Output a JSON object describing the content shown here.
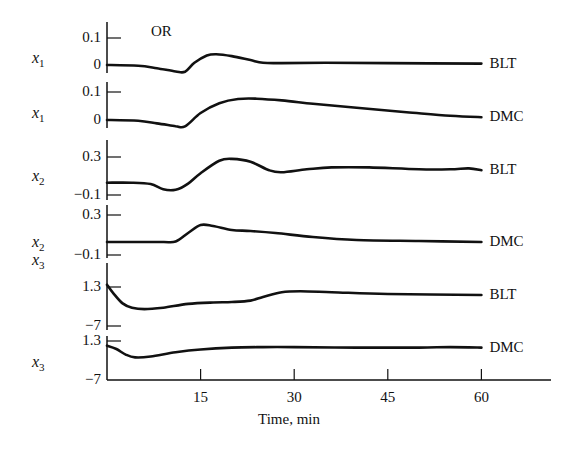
{
  "chart_data": {
    "type": "line",
    "title": "OR",
    "xlabel": "Time, min",
    "x_ticks": [
      15,
      30,
      45,
      60
    ],
    "xlim": [
      0,
      75
    ],
    "grid": false,
    "legend_position": "inline-right",
    "panels": [
      {
        "ylabel": "x1",
        "ylabel_var": "x",
        "ylabel_sub": "1",
        "series_label": "BLT",
        "y_ticks": [
          "0.1",
          "0"
        ],
        "y_tick_values": [
          0.1,
          0
        ],
        "x": [
          0,
          5,
          8,
          11,
          12.5,
          14,
          16,
          17.5,
          20,
          23,
          25,
          28,
          35,
          45,
          60
        ],
        "values": [
          0.0,
          -0.003,
          -0.012,
          -0.024,
          -0.025,
          0.008,
          0.035,
          0.04,
          0.033,
          0.018,
          0.008,
          0.007,
          0.008,
          0.007,
          0.005
        ]
      },
      {
        "ylabel": "x1",
        "ylabel_var": "x",
        "ylabel_sub": "1",
        "series_label": "DMC",
        "y_ticks": [
          "0.1",
          "0"
        ],
        "y_tick_values": [
          0.1,
          0
        ],
        "x": [
          0,
          5,
          8,
          11,
          12.5,
          15,
          18,
          21,
          24,
          28,
          33,
          40,
          48,
          55,
          60
        ],
        "values": [
          0.0,
          -0.003,
          -0.012,
          -0.022,
          -0.023,
          0.025,
          0.06,
          0.075,
          0.076,
          0.07,
          0.058,
          0.044,
          0.028,
          0.015,
          0.01
        ]
      },
      {
        "ylabel": "x2",
        "ylabel_var": "x",
        "ylabel_sub": "2",
        "series_label": "BLT",
        "y_ticks": [
          "0.3",
          "-0.1"
        ],
        "y_tick_values": [
          0.3,
          -0.1
        ],
        "x": [
          0,
          4,
          7,
          9,
          11,
          13,
          15,
          18,
          20,
          23,
          26,
          28,
          32,
          36,
          42,
          50,
          55,
          58,
          60
        ],
        "values": [
          0.03,
          0.03,
          0.015,
          -0.04,
          -0.045,
          0.02,
          0.13,
          0.26,
          0.28,
          0.25,
          0.16,
          0.14,
          0.17,
          0.19,
          0.19,
          0.17,
          0.17,
          0.18,
          0.16
        ],
        "curve_start_value": 0.03
      },
      {
        "ylabel": "x2",
        "ylabel_var": "x",
        "ylabel_sub": "2",
        "series_label": "DMC",
        "y_ticks": [
          "0.3",
          "-0.1"
        ],
        "y_tick_values": [
          0.3,
          -0.1
        ],
        "x": [
          0,
          5,
          9,
          11,
          13,
          15,
          17,
          20,
          23,
          27,
          33,
          40,
          50,
          60
        ],
        "values": [
          0.03,
          0.03,
          0.03,
          0.035,
          0.12,
          0.2,
          0.19,
          0.15,
          0.14,
          0.12,
          0.08,
          0.05,
          0.04,
          0.03
        ]
      },
      {
        "ylabel": "x3",
        "ylabel_var": "x",
        "ylabel_sub": "3",
        "series_label": "BLT",
        "y_ticks": [
          "1.3",
          "-7"
        ],
        "y_tick_values": [
          1.3,
          -7
        ],
        "x": [
          0,
          1,
          2.5,
          4,
          6,
          9,
          13,
          17,
          20,
          23,
          25,
          28,
          31,
          36,
          45,
          60
        ],
        "values": [
          1.8,
          0.0,
          -2.2,
          -3.1,
          -3.4,
          -3.1,
          -2.3,
          -2.0,
          -1.9,
          -1.6,
          -0.8,
          0.2,
          0.4,
          0.2,
          -0.2,
          -0.4
        ]
      },
      {
        "ylabel": "x3",
        "ylabel_var": "x",
        "ylabel_sub": "3",
        "series_label": "DMC",
        "y_ticks": [
          "1.3",
          "-7"
        ],
        "y_tick_values": [
          1.3,
          -7
        ],
        "x": [
          0,
          1.5,
          3,
          4.5,
          7,
          11,
          15,
          20,
          25,
          30,
          40,
          50,
          55,
          60
        ],
        "values": [
          0.3,
          -0.4,
          -1.6,
          -2.2,
          -2.0,
          -1.1,
          -0.5,
          -0.1,
          0.0,
          0.0,
          -0.1,
          -0.1,
          0.0,
          -0.1
        ]
      }
    ]
  },
  "layout": {
    "plot_left_px": 107,
    "px_per_min": 6.24,
    "x_axis_y_px": 380,
    "x_axis_end_px": 551,
    "stroke_color": "#111111"
  }
}
